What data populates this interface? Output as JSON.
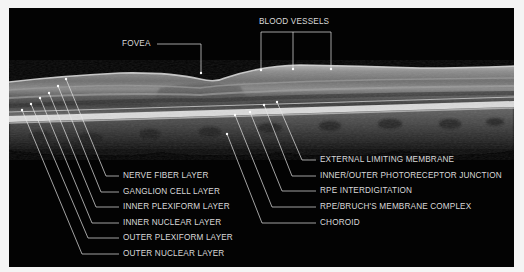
{
  "diagram": {
    "background_color": "#f4f4f4",
    "panel_color": "#030303",
    "label_color": "#d9d9d9",
    "line_color": "#e6e6e6"
  },
  "top_labels": {
    "fovea": "FOVEA",
    "blood_vessels": "BLOOD VESSELS"
  },
  "left_labels": [
    {
      "label": "NERVE FIBER LAYER"
    },
    {
      "label": "GANGLION CELL LAYER"
    },
    {
      "label": "INNER PLEXIFORM LAYER"
    },
    {
      "label": "INNER NUCLEAR LAYER"
    },
    {
      "label": "OUTER PLEXIFORM LAYER"
    },
    {
      "label": "OUTER NUCLEAR LAYER"
    }
  ],
  "right_labels": [
    {
      "label": "EXTERNAL LIMITING MEMBRANE"
    },
    {
      "label": "INNER/OUTER PHOTORECEPTOR JUNCTION"
    },
    {
      "label": "RPE INTERDIGITATION"
    },
    {
      "label": "RPE/BRUCH'S MEMBRANE COMPLEX"
    },
    {
      "label": "CHOROID"
    }
  ]
}
